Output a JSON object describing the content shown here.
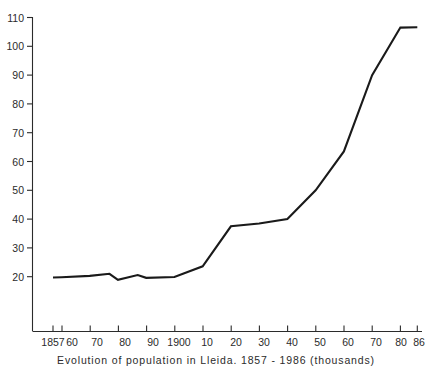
{
  "caption": "Evolution of population in Lleida.  1857 - 1986  (thousands)",
  "chart_data": {
    "type": "line",
    "title": "Evolution of population in Lleida.  1857 - 1986  (thousands)",
    "xlabel": "",
    "ylabel": "",
    "units": "thousands of inhabitants",
    "grid": false,
    "legend": false,
    "xlim": [
      1857,
      1986
    ],
    "ylim": [
      20,
      110
    ],
    "yticks": [
      20,
      30,
      40,
      50,
      60,
      70,
      80,
      90,
      100,
      110
    ],
    "ytick_labels": [
      "20",
      "30",
      "40",
      "50",
      "60",
      "70",
      "80",
      "90",
      "100",
      "110"
    ],
    "xticks": [
      1857,
      1860,
      1870,
      1880,
      1890,
      1900,
      1910,
      1920,
      1930,
      1940,
      1950,
      1960,
      1970,
      1980,
      1986
    ],
    "xtick_labels": [
      "1857",
      "60",
      "70",
      "80",
      "90",
      "1900",
      "10",
      "20",
      "30",
      "40",
      "50",
      "60",
      "70",
      "80",
      "86"
    ],
    "x": [
      1857,
      1860,
      1870,
      1877,
      1880,
      1887,
      1890,
      1900,
      1910,
      1920,
      1930,
      1940,
      1950,
      1960,
      1970,
      1980,
      1986
    ],
    "values": [
      19.7,
      19.8,
      20.3,
      21.0,
      18.9,
      20.6,
      19.6,
      19.9,
      23.6,
      37.5,
      38.5,
      40.0,
      50.0,
      63.5,
      90.0,
      106.5,
      106.6
    ],
    "series": [
      {
        "name": "Population of Lleida",
        "color": "#1a1a1a",
        "values": [
          19.7,
          19.8,
          20.3,
          21.0,
          18.9,
          20.6,
          19.6,
          19.9,
          23.6,
          37.5,
          38.5,
          40.0,
          50.0,
          63.5,
          90.0,
          106.5,
          106.6
        ]
      }
    ]
  },
  "axes": {
    "y_tick_labels": [
      "110",
      "100",
      "90",
      "80",
      "70",
      "60",
      "50",
      "40",
      "30",
      "20"
    ],
    "x_tick_labels": [
      "1857",
      "60",
      "70",
      "80",
      "90",
      "1900",
      "10",
      "20",
      "30",
      "40",
      "50",
      "60",
      "70",
      "80",
      "86"
    ]
  }
}
